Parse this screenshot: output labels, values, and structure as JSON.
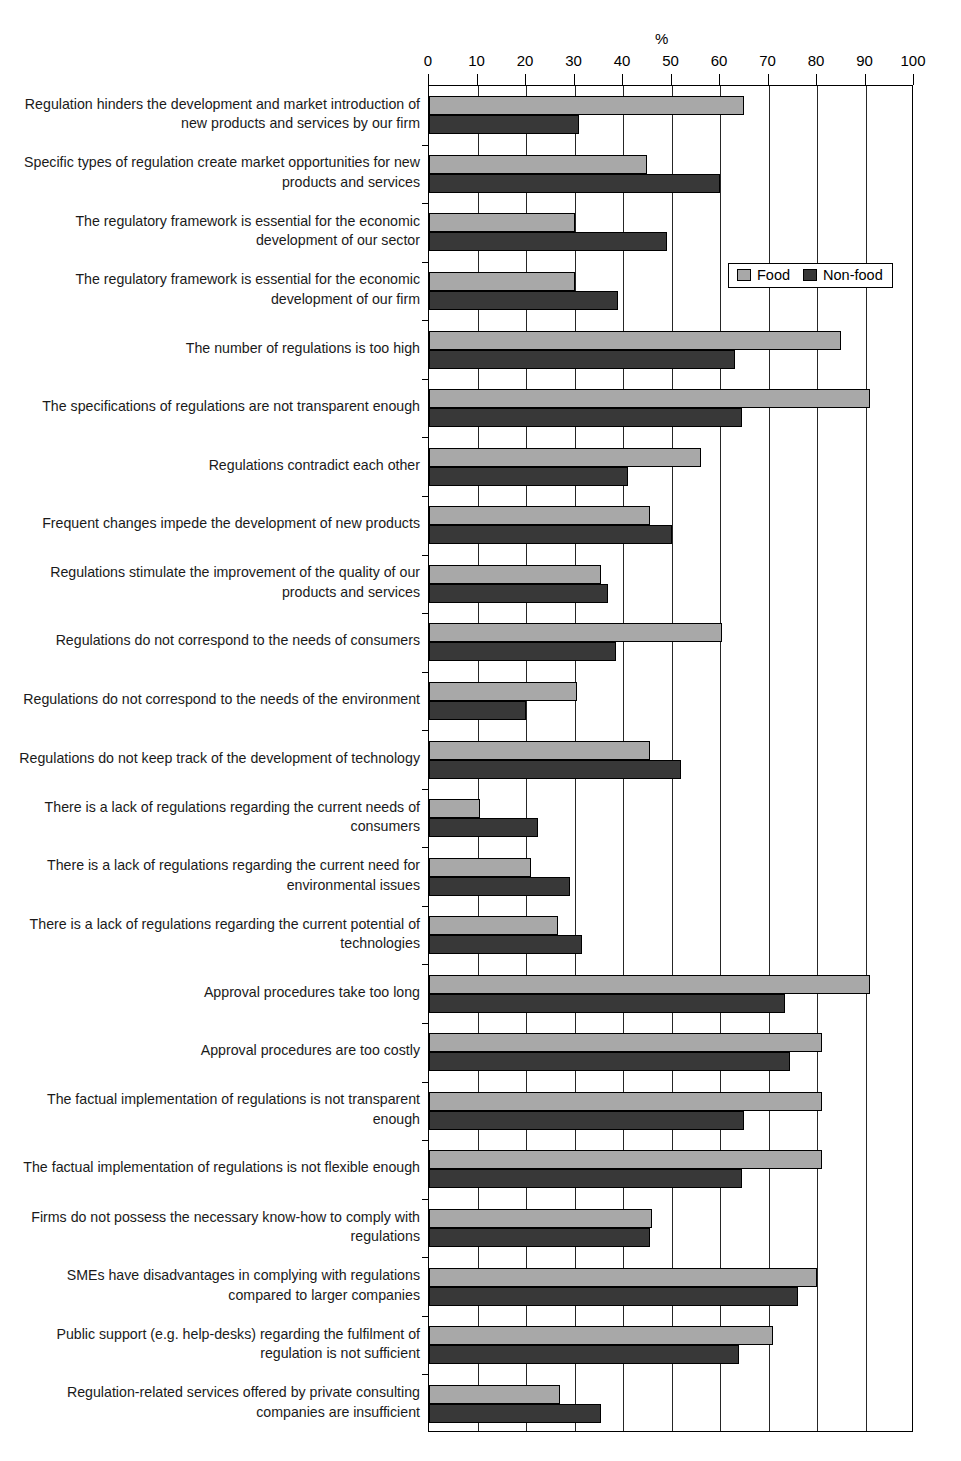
{
  "chart_data": {
    "type": "bar",
    "orientation": "horizontal",
    "title": "",
    "xlabel": "%",
    "ylabel": "",
    "xlim": [
      0,
      100
    ],
    "xticks": [
      0,
      10,
      20,
      30,
      40,
      50,
      60,
      70,
      80,
      90,
      100
    ],
    "grid": true,
    "legend_position": "upper-right-inside",
    "colors": {
      "food": "#a8a8a8",
      "nonfood": "#383838"
    },
    "legend": [
      "Food",
      "Non-food"
    ],
    "categories": [
      "Regulation hinders the development and market introduction of new products and services by our firm",
      "Specific types of regulation create market opportunities for new products and services",
      "The regulatory framework is essential for the economic development of our sector",
      "The regulatory framework is essential for the economic development of our firm",
      "The number of regulations is too high",
      "The specifications of regulations are not transparent enough",
      "Regulations contradict each other",
      "Frequent changes impede the development of new products",
      "Regulations stimulate the improvement of the quality of our products and services",
      "Regulations do not correspond to the needs of consumers",
      "Regulations do not correspond to the needs of the environment",
      "Regulations do not keep track of the development of technology",
      "There is a lack of regulations regarding the current needs of consumers",
      "There is a lack of regulations regarding the current need for environmental issues",
      "There is a lack of regulations regarding the current potential of technologies",
      "Approval procedures take too long",
      "Approval procedures are too costly",
      "The factual implementation of regulations is not transparent enough",
      "The factual implementation of regulations is not flexible enough",
      "Firms do not possess the necessary know-how to comply with regulations",
      "SMEs have disadvantages in complying with regulations compared to larger companies",
      "Public support (e.g. help-desks) regarding the fulfilment of regulation is not sufficient",
      "Regulation-related services offered by private consulting companies are insufficient"
    ],
    "series": [
      {
        "name": "Food",
        "values": [
          65,
          45,
          30,
          30,
          85,
          91,
          56,
          45.5,
          35.5,
          60.5,
          30.5,
          45.5,
          10.5,
          21,
          26.5,
          91,
          81,
          81,
          81,
          46,
          80,
          71,
          27
        ]
      },
      {
        "name": "Non-food",
        "values": [
          31,
          60,
          49,
          39,
          63,
          64.5,
          41,
          50,
          37,
          38.5,
          20,
          52,
          22.5,
          29,
          31.5,
          73.5,
          74.5,
          65,
          64.5,
          45.5,
          76,
          64,
          35.5
        ]
      }
    ]
  }
}
